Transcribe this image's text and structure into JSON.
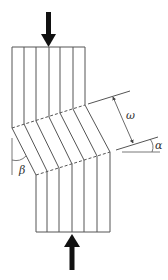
{
  "diagram": {
    "labels": {
      "omega": "ω",
      "alpha": "α",
      "beta": "β"
    },
    "colors": {
      "line": "#555555",
      "arrow": "#111111",
      "label": "#333333",
      "background": "#ffffff"
    },
    "elements": {
      "top_load_arrow": "compressive-load-down",
      "bottom_load_arrow": "compressive-load-up",
      "kink_band_width": "ω",
      "kink_band_inclination": "α",
      "fiber_rotation_angle": "β"
    }
  }
}
